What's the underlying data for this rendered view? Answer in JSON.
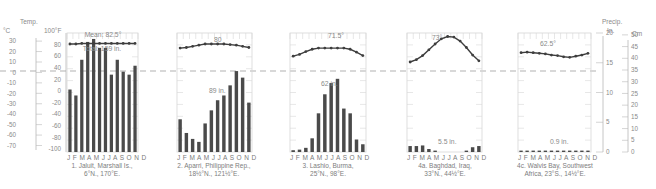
{
  "left_axis": {
    "title": "Temp.",
    "celsius_label": "°C",
    "fahrenheit_label": "100°F",
    "celsius_ticks": [
      "30",
      "20",
      "10",
      "0",
      "-10",
      "-20",
      "-30",
      "-40",
      "-50",
      "-60",
      "-70"
    ],
    "fahrenheit_ticks": [
      "80",
      "60",
      "40",
      "20",
      "0",
      "-20",
      "-40",
      "-60",
      "-80",
      "-100"
    ]
  },
  "right_axis": {
    "title": "Precip.",
    "inches_label": "In.",
    "cm_label": "Cm",
    "inch_ticks": [
      "20",
      "15",
      "10",
      "5",
      "0"
    ],
    "cm_ticks": [
      "50",
      "45",
      "40",
      "35",
      "30",
      "25",
      "20",
      "15",
      "10",
      "5",
      "0"
    ]
  },
  "month_labels": "J F M A M J J A S O N D",
  "chart_data": {
    "type": "bar+line",
    "xlabel": "Month",
    "ylabel_left": "Temp. (°C / °F)",
    "ylabel_right": "Precip. (In. / Cm)",
    "temp_ylim_f": [
      -100,
      100
    ],
    "precip_ylim_in": [
      0,
      20
    ],
    "freezing_line": "dashed line at 0°C / 32°F",
    "categories": [
      "J",
      "F",
      "M",
      "A",
      "M",
      "J",
      "J",
      "A",
      "S",
      "O",
      "N",
      "D"
    ],
    "stations": [
      {
        "id": "1",
        "name": "1. Jaluit, Marshall Is.,",
        "coords": "6°N., 170°E.",
        "temp_label": "Mean: 82.5°",
        "precip_label": "Total: 159 in.",
        "temp_f": [
          81,
          81,
          82,
          82,
          82,
          82,
          82,
          82,
          82,
          82,
          82,
          82
        ],
        "precip_in": [
          10.5,
          9.5,
          15.5,
          18.5,
          19,
          17.5,
          17.5,
          13,
          15.5,
          13.5,
          13,
          14.5
        ]
      },
      {
        "id": "2",
        "name": "2. Aparri, Philippine Rep.,",
        "coords": "18½°N., 121½°E.",
        "temp_label": "80",
        "precip_label": "89 in.",
        "temp_f": [
          74,
          75,
          77,
          79,
          81,
          81,
          81,
          81,
          80,
          79,
          77,
          75
        ],
        "precip_in": [
          5.5,
          3.2,
          2.2,
          1.7,
          4.8,
          7,
          8.7,
          9.5,
          11.2,
          13.6,
          12.5,
          8.3
        ]
      },
      {
        "id": "3",
        "name": "3. Lashio, Burma,",
        "coords": "25°N., 98°E.",
        "temp_label": "71.5°",
        "precip_label": "62 in.",
        "temp_f": [
          60,
          63,
          68,
          72,
          74,
          74,
          74,
          74,
          74,
          72,
          67,
          61
        ],
        "precip_in": [
          0.3,
          0.4,
          0.7,
          2.3,
          6.5,
          9.7,
          11.6,
          12.3,
          7.3,
          6.5,
          2.1,
          1.3
        ]
      },
      {
        "id": "4a",
        "name": "4a. Baghdad, Iraq,",
        "coords": "33°N., 44½°E.",
        "temp_label": "73°",
        "precip_label": "5.5 in.",
        "temp_f": [
          50,
          54,
          61,
          71,
          81,
          90,
          94,
          93,
          86,
          75,
          62,
          52
        ],
        "precip_in": [
          1,
          1,
          1.1,
          0.5,
          0.1,
          0,
          0,
          0,
          0,
          0.1,
          0.8,
          1
        ]
      },
      {
        "id": "4c",
        "name": "4c. Walvis Bay, Southwest",
        "name_line2": "Africa, 23°S., 14½°E.",
        "temp_label": "62.5°",
        "precip_label": "0.9 in.",
        "temp_f": [
          66,
          67,
          66,
          65,
          64,
          62,
          61,
          59,
          58,
          60,
          62,
          65
        ],
        "precip_in": [
          0.1,
          0.1,
          0.1,
          0.1,
          0.1,
          0.1,
          0.1,
          0.1,
          0.1,
          0.1,
          0.1,
          0.1
        ]
      }
    ]
  },
  "captions": {
    "s1": [
      "1. Jaluit, Marshall Is.,",
      "6°N., 170°E."
    ],
    "s2": [
      "2. Aparri, Philippine Rep.,",
      "18½°N., 121½°E."
    ],
    "s3": [
      "3. Lashio, Burma,",
      "25°N., 98°E."
    ],
    "s4": [
      "4a. Baghdad, Iraq,",
      "33°N., 44½°E."
    ],
    "s5": [
      "4c. Walvis Bay, Southwest",
      "Africa, 23°S., 14½°E."
    ]
  },
  "colors": {
    "bar": "#4a4a4a",
    "line": "#3e3e3e",
    "axis": "#b8b8b8",
    "grid": "#d6d6d6",
    "dash": "#a8a8a8",
    "text": "#8a8a8a"
  }
}
